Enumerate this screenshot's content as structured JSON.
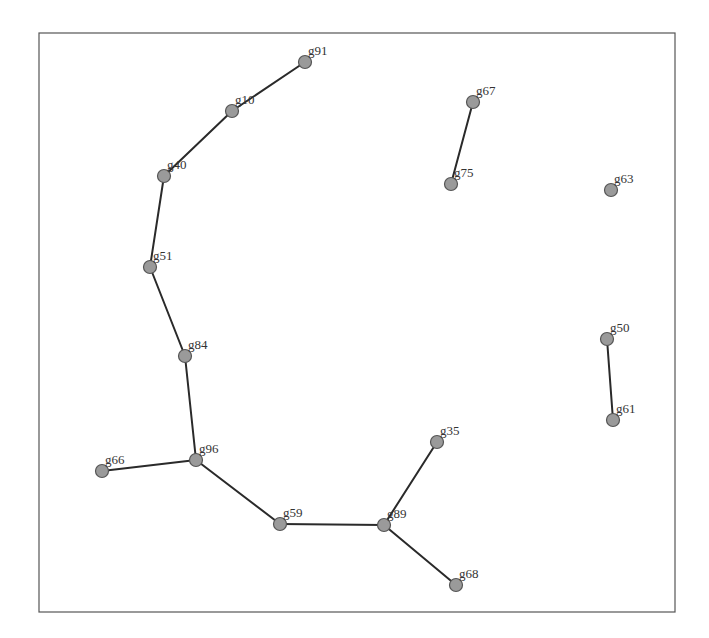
{
  "diagram": {
    "type": "network-graph",
    "frame": {
      "x": 39,
      "y": 33,
      "width": 636,
      "height": 579
    },
    "colors": {
      "node_fill": "#9a9a9a",
      "node_stroke": "#555555",
      "edge": "#2a2a2a",
      "label": "#333333",
      "frame": "#555555"
    },
    "nodes": [
      {
        "id": "g91",
        "label": "g91",
        "x": 305,
        "y": 62
      },
      {
        "id": "g10",
        "label": "g10",
        "x": 232,
        "y": 111
      },
      {
        "id": "g40",
        "label": "g40",
        "x": 164,
        "y": 176
      },
      {
        "id": "g51",
        "label": "g51",
        "x": 150,
        "y": 267
      },
      {
        "id": "g84",
        "label": "g84",
        "x": 185,
        "y": 356
      },
      {
        "id": "g96",
        "label": "g96",
        "x": 196,
        "y": 460
      },
      {
        "id": "g66",
        "label": "g66",
        "x": 102,
        "y": 471
      },
      {
        "id": "g59",
        "label": "g59",
        "x": 280,
        "y": 524
      },
      {
        "id": "g89",
        "label": "g89",
        "x": 384,
        "y": 525
      },
      {
        "id": "g35",
        "label": "g35",
        "x": 437,
        "y": 442
      },
      {
        "id": "g68",
        "label": "g68",
        "x": 456,
        "y": 585
      },
      {
        "id": "g67",
        "label": "g67",
        "x": 473,
        "y": 102
      },
      {
        "id": "g75",
        "label": "g75",
        "x": 451,
        "y": 184
      },
      {
        "id": "g63",
        "label": "g63",
        "x": 611,
        "y": 190
      },
      {
        "id": "g50",
        "label": "g50",
        "x": 607,
        "y": 339
      },
      {
        "id": "g61",
        "label": "g61",
        "x": 613,
        "y": 420
      }
    ],
    "edges": [
      {
        "from": "g91",
        "to": "g10"
      },
      {
        "from": "g10",
        "to": "g40"
      },
      {
        "from": "g40",
        "to": "g51"
      },
      {
        "from": "g51",
        "to": "g84"
      },
      {
        "from": "g84",
        "to": "g96"
      },
      {
        "from": "g96",
        "to": "g66"
      },
      {
        "from": "g96",
        "to": "g59"
      },
      {
        "from": "g59",
        "to": "g89"
      },
      {
        "from": "g89",
        "to": "g35"
      },
      {
        "from": "g89",
        "to": "g68"
      },
      {
        "from": "g67",
        "to": "g75"
      },
      {
        "from": "g50",
        "to": "g61"
      }
    ]
  }
}
